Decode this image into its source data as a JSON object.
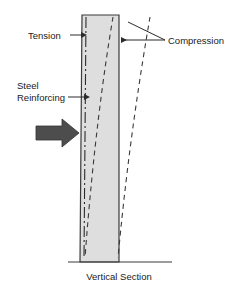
{
  "figure": {
    "caption": "Vertical Section",
    "labels": {
      "tension": "Tension",
      "compression": "Compression",
      "steel_line1": "Steel",
      "steel_line2": "Reinforcing"
    },
    "colors": {
      "column_fill": "#dedede",
      "outline": "#3a3a3a",
      "load_arrow": "#4d4d4d",
      "text": "#1a1a1a",
      "leader": "#2b2b2b",
      "deflection_curve": "#3a3a3a",
      "background": "#ffffff"
    },
    "elements": {
      "column": "concrete-column-vertical-section",
      "centerline": "steel-reinforcing-chain-line",
      "load_arrow": "lateral-load-arrow",
      "deflected_inner": "deflected-shape-inner-dashed",
      "deflected_outer": "deflected-shape-outer-dashed",
      "ground": "ground-base-line"
    }
  }
}
